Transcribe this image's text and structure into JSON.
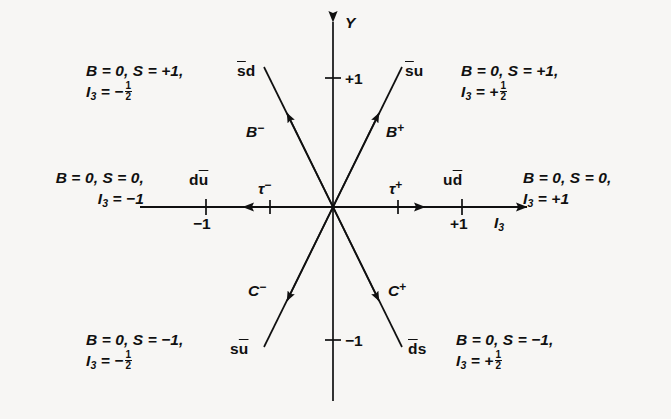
{
  "figure": {
    "type": "weight-diagram",
    "background_color": "#f7f6f4",
    "ink_color": "#101010"
  },
  "axes": {
    "y_axis": {
      "name": "Y",
      "ticks": [
        "+1",
        "-1"
      ]
    },
    "x_axis": {
      "name": "I",
      "name_sub": "3",
      "ticks": [
        "-1",
        "+1"
      ]
    }
  },
  "quadrant_labels": {
    "top_left": {
      "line1_b": "B",
      "line1_eq1": " = 0,",
      "line1_s": " S",
      "line1_eq2": " = +1,",
      "line2_i": "I",
      "line2_sub": "3",
      "line2_eq": " = −",
      "frac_num": "1",
      "frac_den": "2"
    },
    "top_right": {
      "line1_b": "B",
      "line1_eq1": " = 0,",
      "line1_s": " S",
      "line1_eq2": " = +1,",
      "line2_i": "I",
      "line2_sub": "3",
      "line2_eq": " = +",
      "frac_num": "1",
      "frac_den": "2"
    },
    "middle_left": {
      "line1_b": "B",
      "line1_eq1": " = 0,",
      "line1_s": " S",
      "line1_eq2": " = 0,",
      "line2_i": "I",
      "line2_sub": "3",
      "line2_eq": " = −1"
    },
    "middle_right": {
      "line1_b": "B",
      "line1_eq1": " = 0,",
      "line1_s": " S",
      "line1_eq2": " = 0,",
      "line2_i": "I",
      "line2_sub": "3",
      "line2_eq": " = +1"
    },
    "bottom_left": {
      "line1_b": "B",
      "line1_eq1": " = 0,",
      "line1_s": " S",
      "line1_eq2": " = −1,",
      "line2_i": "I",
      "line2_sub": "3",
      "line2_eq": " = −",
      "frac_num": "1",
      "frac_den": "2"
    },
    "bottom_right": {
      "line1_b": "B",
      "line1_eq1": " = 0,",
      "line1_s": " S",
      "line1_eq2": " = −1,",
      "line2_i": "I",
      "line2_sub": "3",
      "line2_eq": " = +",
      "frac_num": "1",
      "frac_den": "2"
    }
  },
  "states": [
    {
      "id": "b-minus",
      "meson_symbol": "B",
      "meson_charge": "−",
      "quark_pre": "s",
      "quark_pre_bar": true,
      "quark_post": "d",
      "quark_post_bar": false,
      "quark_text": "s̄d",
      "i3": -0.5,
      "y": 1,
      "direction": "up-left"
    },
    {
      "id": "b-plus",
      "meson_symbol": "B",
      "meson_charge": "+",
      "quark_pre": "s",
      "quark_pre_bar": true,
      "quark_post": "u",
      "quark_post_bar": false,
      "quark_text": "s̄u",
      "i3": 0.5,
      "y": 1,
      "direction": "up-right"
    },
    {
      "id": "tau-minus",
      "meson_symbol": "τ",
      "meson_charge": "−",
      "quark_pre": "d",
      "quark_pre_bar": false,
      "quark_post": "u",
      "quark_post_bar": true,
      "quark_text": "du̅",
      "i3": -1,
      "y": 0,
      "direction": "left"
    },
    {
      "id": "tau-plus",
      "meson_symbol": "τ",
      "meson_charge": "+",
      "quark_pre": "u",
      "quark_pre_bar": false,
      "quark_post": "d",
      "quark_post_bar": true,
      "quark_text": "ud̄",
      "i3": 1,
      "y": 0,
      "direction": "right"
    },
    {
      "id": "c-minus",
      "meson_symbol": "C",
      "meson_charge": "−",
      "quark_pre": "s",
      "quark_pre_bar": false,
      "quark_post": "u",
      "quark_post_bar": true,
      "quark_text": "su̅",
      "i3": -0.5,
      "y": -1,
      "direction": "down-left"
    },
    {
      "id": "c-plus",
      "meson_symbol": "C",
      "meson_charge": "+",
      "quark_pre": "d",
      "quark_pre_bar": true,
      "quark_post": "s",
      "quark_post_bar": false,
      "quark_text": "d̄s",
      "i3": 0.5,
      "y": -1,
      "direction": "down-right"
    }
  ],
  "quark_labels": {
    "sbar_d": {
      "bar_char": "s",
      "plain": "d"
    },
    "sbar_u": {
      "bar_char": "s",
      "plain": "u"
    },
    "d_ubar": {
      "plain": "d",
      "bar_char": "u"
    },
    "u_dbar": {
      "plain": "u",
      "bar_char": "d"
    },
    "s_ubar": {
      "plain": "s",
      "bar_char": "u"
    },
    "dbar_s": {
      "bar_char": "d",
      "plain": "s"
    }
  },
  "meson_labels": {
    "b_minus": {
      "sym": "B",
      "chg": "−"
    },
    "b_plus": {
      "sym": "B",
      "chg": "+"
    },
    "tau_minus": {
      "sym": "τ",
      "chg": "−"
    },
    "tau_plus": {
      "sym": "τ",
      "chg": "+"
    },
    "c_minus": {
      "sym": "C",
      "chg": "−"
    },
    "c_plus": {
      "sym": "C",
      "chg": "+"
    }
  },
  "ticks": {
    "x_neg1": "−1",
    "x_pos1": "+1",
    "y_pos1": "+1",
    "y_neg1": "−1"
  }
}
